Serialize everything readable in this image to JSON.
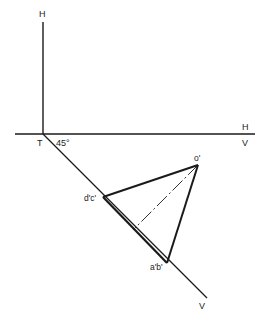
{
  "diagram": {
    "type": "orthographic-projection",
    "labels": {
      "top_h": "H",
      "xy_right_h": "H",
      "xy_right_v": "V",
      "origin_t": "T",
      "angle": "45°",
      "bottom_v": "V",
      "apex_o": "o'",
      "vertex_dc": "d'c'",
      "vertex_ab": "a'b'"
    },
    "colors": {
      "ink": "#1a1a1a",
      "background": "#ffffff"
    }
  }
}
